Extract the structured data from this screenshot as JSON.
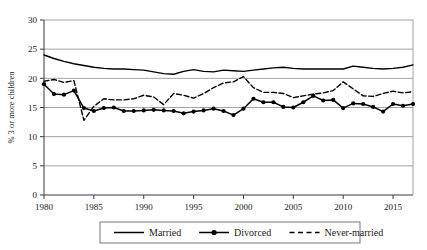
{
  "chart_data": {
    "type": "line",
    "title": "",
    "xlabel": "",
    "ylabel": "% 3 or more children",
    "xlim": [
      1980,
      2017
    ],
    "ylim": [
      0,
      30
    ],
    "ytick_values": [
      0,
      5,
      10,
      15,
      20,
      25,
      30
    ],
    "ytick_labels": [
      "0",
      "5",
      "10",
      "15",
      "20",
      "25",
      "30"
    ],
    "xtick_values": [
      1980,
      1985,
      1990,
      1995,
      2000,
      2005,
      2010,
      2015
    ],
    "xtick_labels": [
      "1980",
      "1985",
      "1990",
      "1995",
      "2000",
      "2005",
      "2010",
      "2015"
    ],
    "grid": "horizontal",
    "legend_position": "bottom",
    "x": [
      1980,
      1981,
      1982,
      1983,
      1984,
      1985,
      1986,
      1987,
      1988,
      1989,
      1990,
      1991,
      1992,
      1993,
      1994,
      1995,
      1996,
      1997,
      1998,
      1999,
      2000,
      2001,
      2002,
      2003,
      2004,
      2005,
      2006,
      2007,
      2008,
      2009,
      2010,
      2011,
      2012,
      2013,
      2014,
      2015,
      2016,
      2017
    ],
    "series": [
      {
        "name": "Married",
        "style": "solid",
        "marker": "none",
        "color": "#000000",
        "values": [
          24.0,
          23.4,
          22.9,
          22.5,
          22.2,
          21.9,
          21.7,
          21.6,
          21.6,
          21.5,
          21.4,
          21.1,
          20.8,
          20.7,
          21.2,
          21.5,
          21.2,
          21.1,
          21.4,
          21.3,
          21.2,
          21.4,
          21.6,
          21.8,
          21.9,
          21.7,
          21.6,
          21.6,
          21.6,
          21.6,
          21.6,
          22.1,
          21.9,
          21.7,
          21.6,
          21.7,
          21.9,
          22.3
        ]
      },
      {
        "name": "Divorced",
        "style": "solid",
        "marker": "circle",
        "color": "#000000",
        "values": [
          19.0,
          17.3,
          17.2,
          17.9,
          14.9,
          14.4,
          14.9,
          15.0,
          14.4,
          14.4,
          14.5,
          14.6,
          14.5,
          14.4,
          14.0,
          14.3,
          14.5,
          14.8,
          14.4,
          13.7,
          14.8,
          16.5,
          15.9,
          15.9,
          15.1,
          15.0,
          15.9,
          17.0,
          16.2,
          16.3,
          14.9,
          15.7,
          15.6,
          15.1,
          14.3,
          15.6,
          15.3,
          15.6
        ]
      },
      {
        "name": "Never-married",
        "style": "dashed",
        "marker": "none",
        "color": "#000000",
        "values": [
          19.5,
          19.8,
          19.3,
          19.6,
          12.8,
          15.2,
          16.5,
          16.3,
          16.3,
          16.5,
          17.1,
          16.8,
          15.5,
          17.4,
          17.1,
          16.6,
          17.4,
          18.4,
          19.2,
          19.4,
          20.3,
          18.4,
          17.6,
          17.6,
          17.4,
          16.7,
          17.0,
          17.3,
          17.5,
          17.9,
          19.4,
          18.2,
          17.0,
          16.9,
          17.4,
          17.8,
          17.5,
          17.7
        ]
      }
    ]
  },
  "legend": {
    "items": [
      {
        "label": "Married",
        "style": "solid",
        "marker": "none"
      },
      {
        "label": "Divorced",
        "style": "solid",
        "marker": "circle"
      },
      {
        "label": "Never-married",
        "style": "dashed",
        "marker": "none"
      }
    ]
  }
}
